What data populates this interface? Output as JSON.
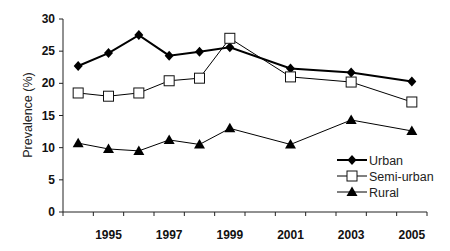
{
  "chart_data": {
    "type": "line",
    "title": "",
    "xlabel": "",
    "ylabel": "Prevalence (%)",
    "ylim": [
      0,
      30
    ],
    "yticks": [
      0,
      5,
      10,
      15,
      20,
      25,
      30
    ],
    "xlim": [
      1993.5,
      2005.5
    ],
    "xtick_labels": [
      "1995",
      "1997",
      "1999",
      "2001",
      "2003",
      "2005"
    ],
    "grid": false,
    "legend_position": "lower right",
    "x": [
      1994,
      1995,
      1996,
      1997,
      1998,
      1999,
      2001,
      2003,
      2005
    ],
    "series": [
      {
        "name": "Urban",
        "marker": "filled-diamond",
        "color": "#000000",
        "line_width": 2,
        "values": [
          22.7,
          24.7,
          27.5,
          24.3,
          24.9,
          25.6,
          22.3,
          21.7,
          20.3
        ]
      },
      {
        "name": "Semi-urban",
        "marker": "open-square",
        "color": "#000000",
        "line_width": 1,
        "values": [
          18.5,
          18.0,
          18.5,
          20.4,
          20.8,
          27.0,
          21.0,
          20.2,
          17.1
        ]
      },
      {
        "name": "Rural",
        "marker": "filled-triangle",
        "color": "#000000",
        "line_width": 1,
        "values": [
          10.7,
          9.8,
          9.5,
          11.2,
          10.5,
          13.0,
          10.5,
          14.3,
          12.6
        ]
      }
    ]
  }
}
